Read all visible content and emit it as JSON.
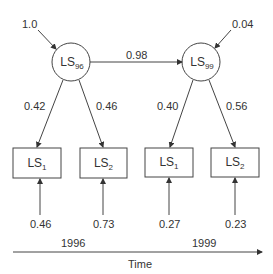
{
  "latent": [
    {
      "name": "LS",
      "sub": "96",
      "error": "1.0"
    },
    {
      "name": "LS",
      "sub": "99",
      "error": "0.04"
    }
  ],
  "path_96_99": "0.98",
  "loadings": {
    "l96_1": "0.42",
    "l96_2": "0.46",
    "l99_1": "0.40",
    "l99_2": "0.56"
  },
  "indicators": [
    {
      "name": "LS",
      "sub": "1",
      "error": "0.46"
    },
    {
      "name": "LS",
      "sub": "2",
      "error": "0.73"
    },
    {
      "name": "LS",
      "sub": "1",
      "error": "0.27"
    },
    {
      "name": "LS",
      "sub": "2",
      "error": "0.23"
    }
  ],
  "timeline": {
    "start": "1996",
    "end": "1999",
    "label": "Time"
  }
}
